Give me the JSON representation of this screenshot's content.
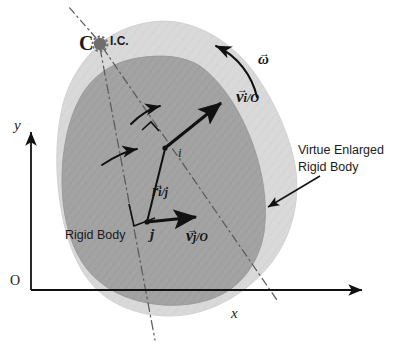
{
  "figure": {
    "width": 397,
    "height": 352,
    "background": "#ffffff"
  },
  "colors": {
    "outer_body_fill": "#d9d9d9",
    "inner_body_fill": "#a3a3a3",
    "outer_body_stroke": "#cccccc",
    "inner_body_stroke": "#9a9a9a",
    "line": "#111111",
    "dashdot": "#555555",
    "ic_marker": "#6e6e6e",
    "text": "#1a1a1a"
  },
  "labels": {
    "axis_y": "y",
    "axis_x": "x",
    "origin": "O",
    "point_c": "C",
    "instant_center": "I.C.",
    "point_i": "i",
    "point_j": "j",
    "omega": "ω",
    "v_i_main": "v",
    "v_i_sub": "i/O",
    "v_j_main": "v",
    "v_j_sub": "j/O",
    "r_main": "r",
    "r_sub": "i/j",
    "vector_bar": "→",
    "rigid_body": "Rigid Body",
    "virtue_line1": "Virtue Enlarged",
    "virtue_line2": "Rigid Body"
  },
  "geometry": {
    "origin_px": [
      31,
      290
    ],
    "point_i_px": [
      165,
      148
    ],
    "point_j_px": [
      147,
      222
    ],
    "ic_px": [
      100,
      44
    ],
    "v_i_tip_px": [
      226,
      99
    ],
    "v_j_tip_px": [
      201,
      217
    ],
    "x_axis_tip_px": [
      366,
      290
    ],
    "y_axis_tip_px": [
      31,
      130
    ]
  },
  "annotations": {
    "ic_marker_name": "instant-center-marker",
    "omega_arc_name": "angular-velocity-arc",
    "pointer_name": "virtue-body-pointer-arrow"
  }
}
